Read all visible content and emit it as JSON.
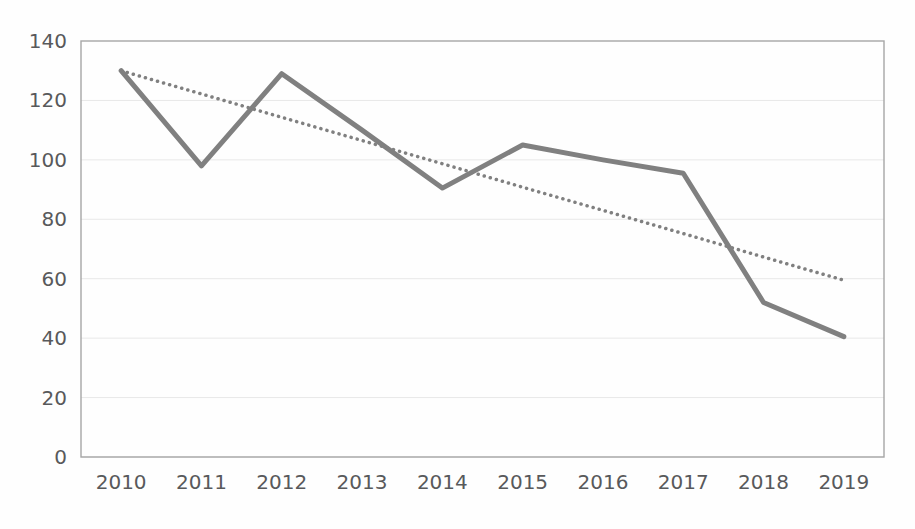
{
  "chart_data": {
    "type": "line",
    "title": "",
    "subtitle": "",
    "xlabel": "",
    "ylabel": "",
    "categories": [
      "2010",
      "2011",
      "2012",
      "2013",
      "2014",
      "2015",
      "2016",
      "2017",
      "2018",
      "2019"
    ],
    "x": [
      2010,
      2011,
      2012,
      2013,
      2014,
      2015,
      2016,
      2017,
      2018,
      2019
    ],
    "ylim": [
      0,
      140
    ],
    "yticks": [
      0,
      20,
      40,
      60,
      80,
      100,
      120,
      140
    ],
    "ytick_labels": [
      "0",
      "20",
      "40",
      "60",
      "80",
      "100",
      "120",
      "140"
    ],
    "grid": {
      "horizontal": true,
      "vertical": false,
      "color": "#e8e8e8"
    },
    "legend": {
      "visible": false,
      "position": "none",
      "entries": []
    },
    "plot_border": {
      "visible": true,
      "color": "#a6a6a6"
    },
    "annotations": [],
    "series": [
      {
        "name": "Series 1",
        "type": "line",
        "style": "solid",
        "color": "#808080",
        "width": 5,
        "markers": false,
        "values": [
          130,
          98,
          129,
          110,
          90.5,
          105,
          100,
          95.5,
          52,
          40.5
        ]
      },
      {
        "name": "Linear trendline",
        "type": "line",
        "style": "dotted",
        "color": "#808080",
        "width": 3.5,
        "markers": false,
        "trendline": true,
        "endpoints": [
          130,
          59.5
        ],
        "values": [
          130,
          122.2,
          114.3,
          106.5,
          98.7,
          90.8,
          83.0,
          75.2,
          67.3,
          59.5
        ]
      }
    ]
  },
  "ghost_text": {
    "line1": "                                                                        ",
    "line2": "          ",
    "line3": "       ",
    "line4": "      ",
    "line5": "     ",
    "line6": "    "
  }
}
